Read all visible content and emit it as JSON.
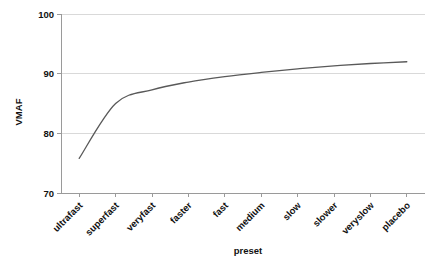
{
  "chart_data": {
    "type": "line",
    "title": "",
    "xlabel": "preset",
    "ylabel": "VMAF",
    "categories": [
      "ultrafast",
      "superfast",
      "veryfast",
      "faster",
      "fast",
      "medium",
      "slow",
      "slower",
      "veryslow",
      "placebo"
    ],
    "values": [
      75.8,
      85.0,
      87.3,
      88.6,
      89.5,
      90.2,
      90.8,
      91.3,
      91.7,
      92.0
    ],
    "series": [
      {
        "name": "VMAF",
        "values": [
          75.8,
          85.0,
          87.3,
          88.6,
          89.5,
          90.2,
          90.8,
          91.3,
          91.7,
          92.0
        ],
        "color": "#595959"
      }
    ],
    "ylim": [
      70,
      100
    ],
    "y_ticks": [
      70,
      80,
      90,
      100
    ],
    "y_tick_labels": [
      "70",
      "80",
      "90",
      "100"
    ],
    "grid": "horizontal",
    "legend": "none",
    "x_tick_rotation": 45,
    "gridline_color": "#d9d9d9",
    "axis_color": "#9a9a9a",
    "background_color": "#ffffff"
  },
  "axes": {
    "y_title": "VMAF",
    "x_title": "preset"
  }
}
